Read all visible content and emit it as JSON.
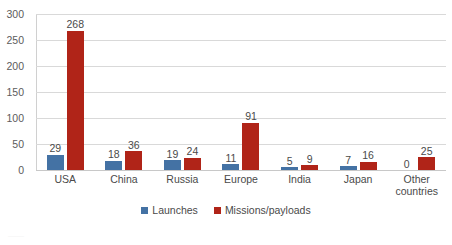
{
  "chart_data": {
    "type": "bar",
    "title": "",
    "xlabel": "",
    "ylabel": "",
    "ylim": [
      0,
      300
    ],
    "yticks": [
      0,
      50,
      100,
      150,
      200,
      250,
      300
    ],
    "ytick_labels": [
      "0",
      "50",
      "100",
      "150",
      "200",
      "250",
      "300"
    ],
    "grid": true,
    "legend_position": "bottom",
    "categories": [
      "USA",
      "China",
      "Russia",
      "Europe",
      "India",
      "Japan",
      "Other countries"
    ],
    "category_labels": [
      [
        "USA"
      ],
      [
        "China"
      ],
      [
        "Russia"
      ],
      [
        "Europe"
      ],
      [
        "India"
      ],
      [
        "Japan"
      ],
      [
        "Other",
        "countries"
      ]
    ],
    "series": [
      {
        "name": "Launches",
        "color": "#4472a4",
        "values": [
          29,
          18,
          19,
          11,
          5,
          7,
          0
        ],
        "value_labels": [
          "29",
          "18",
          "19",
          "11",
          "5",
          "7",
          "0"
        ]
      },
      {
        "name": "Missions/payloads",
        "color": "#b02418",
        "values": [
          268,
          36,
          24,
          91,
          9,
          16,
          25
        ],
        "value_labels": [
          "268",
          "36",
          "24",
          "91",
          "9",
          "16",
          "25"
        ]
      }
    ]
  },
  "legend": {
    "items": [
      {
        "label": "Launches",
        "color": "#4472a4"
      },
      {
        "label": "Missions/payloads",
        "color": "#b02418"
      }
    ]
  },
  "artifact": {
    "text": "——"
  }
}
